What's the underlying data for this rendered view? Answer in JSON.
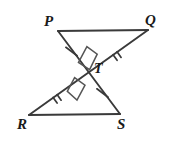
{
  "figure": {
    "background_color": "#ffffff",
    "stroke_color": "#3a3a3a",
    "label_color": "#1a1a1a",
    "width": 170,
    "height": 146
  },
  "labels": {
    "P": "P",
    "Q": "Q",
    "R": "R",
    "S": "S",
    "T": "T"
  },
  "points": {
    "P": {
      "x": 58,
      "y": 31
    },
    "Q": {
      "x": 148,
      "y": 30
    },
    "R": {
      "x": 29,
      "y": 115
    },
    "S": {
      "x": 120,
      "y": 114
    },
    "T": {
      "x": 85,
      "y": 72
    }
  },
  "segments": [
    {
      "name": "PQ",
      "from": "P",
      "to": "Q",
      "ticks": 0
    },
    {
      "name": "RS",
      "from": "R",
      "to": "S",
      "ticks": 0
    },
    {
      "name": "PT",
      "from": "P",
      "to": "T",
      "ticks": 1
    },
    {
      "name": "TS",
      "from": "T",
      "to": "S",
      "ticks": 1
    },
    {
      "name": "RT",
      "from": "R",
      "to": "T",
      "ticks": 2
    },
    {
      "name": "TQ",
      "from": "T",
      "to": "Q",
      "ticks": 2
    }
  ],
  "right_angle_marks": [
    {
      "name": "upper-right-angle",
      "at": "T",
      "side": "above"
    },
    {
      "name": "lower-right-angle",
      "at": "T",
      "side": "below"
    }
  ]
}
